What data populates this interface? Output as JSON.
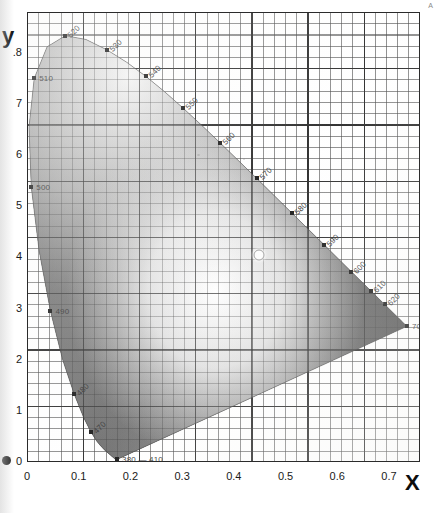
{
  "axes": {
    "x_title": "X",
    "y_title": "y",
    "x_ticks": [
      "0",
      "0.1",
      "0.2",
      "0.3",
      "0.4",
      "0.5",
      "0.6",
      "0.7"
    ],
    "y_ticks": [
      "0",
      "1",
      "2",
      "3",
      "4",
      "5",
      "6",
      "7",
      ".8"
    ]
  },
  "corner_mark": "A",
  "chart_data": {
    "type": "scatter",
    "xlabel": "X",
    "ylabel": "y",
    "xlim": [
      0,
      0.76
    ],
    "ylim": [
      0,
      0.88
    ],
    "grid": "major every 0.1, minor every 0.02",
    "legend": "none",
    "x_tick_values": [
      0,
      0.1,
      0.2,
      0.3,
      0.4,
      0.5,
      0.6,
      0.7
    ],
    "y_tick_values": [
      0,
      0.1,
      0.2,
      0.3,
      0.4,
      0.5,
      0.6,
      0.7,
      0.8
    ],
    "x_tick_labels": [
      "0",
      "0.1",
      "0.2",
      "0.3",
      "0.4",
      "0.5",
      "0.6",
      "0.7"
    ],
    "y_tick_labels": [
      "0",
      "1",
      "2",
      "3",
      "4",
      "5",
      "6",
      "7",
      ".8"
    ],
    "annotations": [
      {
        "label": "520",
        "x": 0.0743,
        "y": 0.8338
      },
      {
        "label": "530",
        "x": 0.1547,
        "y": 0.8059
      },
      {
        "label": "540",
        "x": 0.2296,
        "y": 0.7543
      },
      {
        "label": "550",
        "x": 0.3016,
        "y": 0.6923
      },
      {
        "label": "560",
        "x": 0.3731,
        "y": 0.6245
      },
      {
        "label": "570",
        "x": 0.4441,
        "y": 0.5547
      },
      {
        "label": "580",
        "x": 0.5125,
        "y": 0.4866
      },
      {
        "label": "590",
        "x": 0.5752,
        "y": 0.4242
      },
      {
        "label": "600",
        "x": 0.627,
        "y": 0.3725
      },
      {
        "label": "610",
        "x": 0.6658,
        "y": 0.334
      },
      {
        "label": "620",
        "x": 0.6915,
        "y": 0.3083
      },
      {
        "label": "700 — 780",
        "x": 0.7347,
        "y": 0.2653
      },
      {
        "label": "510",
        "x": 0.0139,
        "y": 0.7502
      },
      {
        "label": "500",
        "x": 0.0082,
        "y": 0.5384
      },
      {
        "label": "490",
        "x": 0.0454,
        "y": 0.295
      },
      {
        "label": "480",
        "x": 0.0913,
        "y": 0.1327
      },
      {
        "label": "470",
        "x": 0.1241,
        "y": 0.0578
      },
      {
        "label": "380 — 410",
        "x": 0.1741,
        "y": 0.005
      }
    ],
    "spectral_locus": [
      [
        0.1741,
        0.005
      ],
      [
        0.174,
        0.005
      ],
      [
        0.1738,
        0.0049
      ],
      [
        0.1736,
        0.0049
      ],
      [
        0.1733,
        0.0048
      ],
      [
        0.173,
        0.0048
      ],
      [
        0.1726,
        0.0048
      ],
      [
        0.1721,
        0.0048
      ],
      [
        0.1714,
        0.0051
      ],
      [
        0.1703,
        0.0058
      ],
      [
        0.1689,
        0.0069
      ],
      [
        0.1669,
        0.0086
      ],
      [
        0.1644,
        0.0109
      ],
      [
        0.1611,
        0.0138
      ],
      [
        0.1566,
        0.0177
      ],
      [
        0.151,
        0.0227
      ],
      [
        0.144,
        0.0297
      ],
      [
        0.1355,
        0.0399
      ],
      [
        0.1241,
        0.0578
      ],
      [
        0.1096,
        0.0868
      ],
      [
        0.0913,
        0.1327
      ],
      [
        0.0687,
        0.2007
      ],
      [
        0.0454,
        0.295
      ],
      [
        0.0235,
        0.4127
      ],
      [
        0.0082,
        0.5384
      ],
      [
        0.0039,
        0.6548
      ],
      [
        0.0139,
        0.7502
      ],
      [
        0.0389,
        0.812
      ],
      [
        0.0743,
        0.8338
      ],
      [
        0.1142,
        0.8262
      ],
      [
        0.1547,
        0.8059
      ],
      [
        0.1929,
        0.7816
      ],
      [
        0.2296,
        0.7543
      ],
      [
        0.2658,
        0.7243
      ],
      [
        0.3016,
        0.6923
      ],
      [
        0.3373,
        0.6589
      ],
      [
        0.3731,
        0.6245
      ],
      [
        0.4087,
        0.5896
      ],
      [
        0.4441,
        0.5547
      ],
      [
        0.4788,
        0.5202
      ],
      [
        0.5125,
        0.4866
      ],
      [
        0.5448,
        0.4544
      ],
      [
        0.5752,
        0.4242
      ],
      [
        0.6029,
        0.3965
      ],
      [
        0.627,
        0.3725
      ],
      [
        0.6482,
        0.3514
      ],
      [
        0.6658,
        0.334
      ],
      [
        0.6801,
        0.3197
      ],
      [
        0.6915,
        0.3083
      ],
      [
        0.7006,
        0.2993
      ],
      [
        0.7079,
        0.292
      ],
      [
        0.714,
        0.2859
      ],
      [
        0.719,
        0.2809
      ],
      [
        0.723,
        0.277
      ],
      [
        0.726,
        0.274
      ],
      [
        0.7283,
        0.2717
      ],
      [
        0.73,
        0.27
      ],
      [
        0.7311,
        0.2689
      ],
      [
        0.732,
        0.268
      ],
      [
        0.7327,
        0.2673
      ],
      [
        0.7334,
        0.2666
      ],
      [
        0.734,
        0.266
      ],
      [
        0.7344,
        0.2656
      ],
      [
        0.7346,
        0.2654
      ],
      [
        0.7347,
        0.2653
      ]
    ],
    "white_point": {
      "label": "",
      "x": 0.4476,
      "y": 0.4074
    }
  }
}
